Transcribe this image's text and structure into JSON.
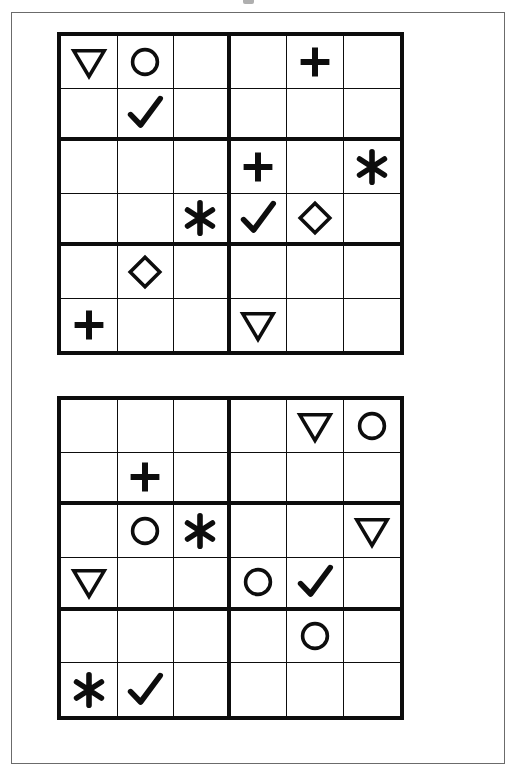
{
  "page": {
    "background_color": "#ffffff",
    "ink_color": "#0d0d0d",
    "frame_color": "#6b6b6b"
  },
  "symbol_legend": {
    "triangle-down": "▽",
    "circle": "○",
    "plus": "+",
    "check": "✓",
    "asterisk": "✱",
    "diamond": "◇",
    "empty": ""
  },
  "puzzles": [
    {
      "id": "puzzle-1",
      "rows": 6,
      "cols": 6,
      "block_cols": 3,
      "block_rows": 2,
      "cells": [
        [
          "triangle-down",
          "circle",
          "empty",
          "empty",
          "plus",
          "empty"
        ],
        [
          "empty",
          "check",
          "empty",
          "empty",
          "empty",
          "empty"
        ],
        [
          "empty",
          "empty",
          "empty",
          "plus",
          "empty",
          "asterisk"
        ],
        [
          "empty",
          "empty",
          "asterisk",
          "check",
          "diamond",
          "empty"
        ],
        [
          "empty",
          "diamond",
          "empty",
          "empty",
          "empty",
          "empty"
        ],
        [
          "plus",
          "empty",
          "empty",
          "triangle-down",
          "empty",
          "empty"
        ]
      ]
    },
    {
      "id": "puzzle-2",
      "rows": 6,
      "cols": 6,
      "block_cols": 3,
      "block_rows": 2,
      "cells": [
        [
          "empty",
          "empty",
          "empty",
          "empty",
          "triangle-down",
          "circle"
        ],
        [
          "empty",
          "plus",
          "empty",
          "empty",
          "empty",
          "empty"
        ],
        [
          "empty",
          "circle",
          "asterisk",
          "empty",
          "empty",
          "triangle-down"
        ],
        [
          "triangle-down",
          "empty",
          "empty",
          "circle",
          "check",
          "empty"
        ],
        [
          "empty",
          "empty",
          "empty",
          "empty",
          "circle",
          "empty"
        ],
        [
          "asterisk",
          "check",
          "empty",
          "empty",
          "empty",
          "empty"
        ]
      ]
    }
  ]
}
